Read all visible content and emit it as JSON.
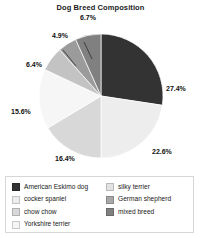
{
  "chart_data": {
    "type": "pie",
    "title": "Dog Breed Composition",
    "xlabel": "",
    "ylabel": "",
    "legend_position": "bottom",
    "grid": false,
    "categories": [
      "American Eskimo dog",
      "cocker spaniel",
      "chow chow",
      "Yorkshire terrier",
      "silky terrier",
      "German shepherd",
      "mixed breed"
    ],
    "values": [
      27.4,
      22.6,
      16.4,
      15.6,
      6.4,
      4.9,
      6.7
    ],
    "value_labels": [
      "27.4%",
      "22.6%",
      "16.4%",
      "15.6%",
      "6.4%",
      "4.9%",
      "6.7%"
    ],
    "colors": [
      "#333333",
      "#ededed",
      "#d8d8d8",
      "#f6f6f6",
      "#c3c3c3",
      "#9b9b9b",
      "#808080"
    ]
  },
  "title": "Dog Breed Composition",
  "labels": {
    "s0": "27.4%",
    "s1": "22.6%",
    "s2": "16.4%",
    "s3": "15.6%",
    "s4": "6.4%",
    "s5": "4.9%",
    "s6": "6.7%"
  },
  "legend": {
    "left": [
      {
        "label": "American Eskimo dog",
        "color": "#333333"
      },
      {
        "label": "cocker spaniel",
        "color": "#ededed"
      },
      {
        "label": "chow chow",
        "color": "#d8d8d8"
      },
      {
        "label": "Yorkshire terrier",
        "color": "#f6f6f6"
      }
    ],
    "right": [
      {
        "label": "silky terrier",
        "color": "#e2e2e2"
      },
      {
        "label": "German shepherd",
        "color": "#a8a8a8"
      },
      {
        "label": "mixed breed",
        "color": "#808080"
      }
    ]
  }
}
